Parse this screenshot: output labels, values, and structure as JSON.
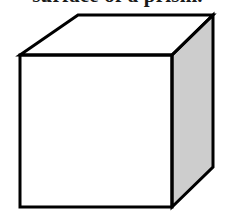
{
  "page": {
    "width": 227,
    "height": 218,
    "background_color": "#ffffff"
  },
  "caption": {
    "text": "surface of a prism.",
    "note": "cropped at top of image; only lower edge of glyphs visible",
    "color": "#1a1a1a"
  },
  "figure": {
    "name": "cube",
    "colors": {
      "outline": "#000000",
      "front_face": "#ffffff",
      "top_face": "#ffffff",
      "right_face": "#cdcdcd"
    },
    "stroke_width": 3,
    "vertices": {
      "front_top_left": [
        20,
        55
      ],
      "front_top_right": [
        172,
        55
      ],
      "front_bottom_right": [
        172,
        207
      ],
      "front_bottom_left": [
        20,
        207
      ],
      "back_top_left": [
        78,
        15
      ],
      "back_top_right": [
        213,
        15
      ],
      "back_bottom_right": [
        213,
        167
      ]
    },
    "faces": {
      "front": "20,55 172,55 172,207 20,207",
      "top": "20,55 78,15 213,15 172,55",
      "right": "172,55 213,15 213,167 172,207"
    }
  }
}
